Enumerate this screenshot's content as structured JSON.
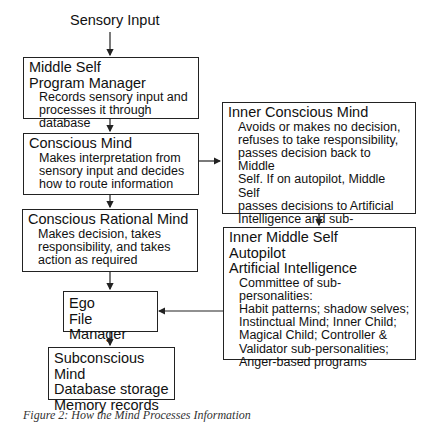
{
  "input_label": "Sensory Input",
  "boxes": {
    "middle_self": {
      "titles": [
        "Middle Self",
        "Program Manager"
      ],
      "desc": [
        "Records sensory input and",
        "processes it through database"
      ]
    },
    "conscious_mind": {
      "titles": [
        "Conscious Mind"
      ],
      "desc": [
        "Makes interpretation from",
        "sensory input and decides",
        "how to route information"
      ]
    },
    "conscious_rational_mind": {
      "titles": [
        "Conscious Rational Mind"
      ],
      "desc": [
        "Makes decision, takes",
        "responsibility, and takes",
        "action as required"
      ]
    },
    "ego": {
      "titles": [
        "Ego",
        "File Manager"
      ]
    },
    "subconscious_mind": {
      "titles": [
        "Subconscious Mind",
        "Database storage",
        "Memory records"
      ]
    },
    "inner_conscious_mind": {
      "titles": [
        "Inner Conscious Mind"
      ],
      "desc": [
        "Avoids or makes no decision,",
        "refuses to take responsibility,",
        "passes decision back to Middle",
        "Self. If on autopilot, Middle Self",
        "passes decisions to Artificial",
        "Intelligence and sub-personalities"
      ]
    },
    "inner_middle_self": {
      "titles": [
        "Inner Middle Self",
        "Autopilot",
        "Artificial Intelligence"
      ],
      "desc": [
        "Committee of sub-personalities:",
        "Habit patterns; shadow selves;",
        "Instinctual Mind; Inner Child;",
        "Magical Child; Controller &",
        "Validator sub-personalities;",
        "Anger-based programs"
      ]
    }
  },
  "caption": "Figure 2: How the Mind Processes Information"
}
